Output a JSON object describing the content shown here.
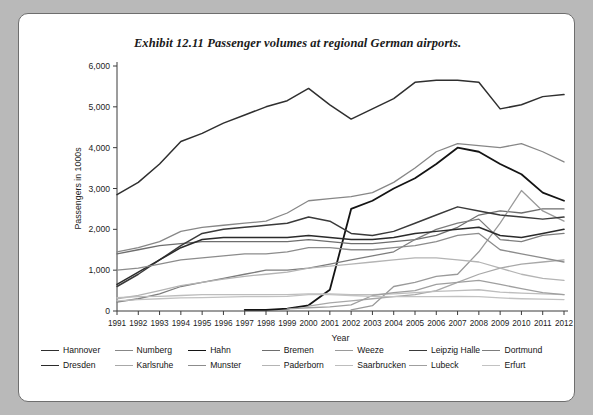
{
  "figure": {
    "title": "Exhibit 12.11   Passenger volumes at regional German airports.",
    "background_outer": "#b9b9b9",
    "background_panel": "#ffffff"
  },
  "chart_data": {
    "type": "line",
    "title": "Exhibit 12.11   Passenger volumes at regional German airports.",
    "xlabel": "Year",
    "ylabel": "Passengers in 1000s",
    "x": [
      1991,
      1992,
      1993,
      1994,
      1995,
      1996,
      1997,
      1998,
      1999,
      2000,
      2001,
      2002,
      2003,
      2004,
      2005,
      2006,
      2007,
      2008,
      2009,
      2010,
      2011,
      2012
    ],
    "xticklabels": [
      "1991",
      "1992",
      "1993",
      "1994",
      "1995",
      "1996",
      "1997",
      "1998",
      "1999",
      "2000",
      "2001",
      "2002",
      "2003",
      "2004",
      "2005",
      "2006",
      "2007",
      "2008",
      "2009",
      "2010",
      "2011",
      "2012"
    ],
    "yticklabels": [
      "0",
      "1,000",
      "2,000",
      "3,000",
      "4,000",
      "5,000",
      "6,000"
    ],
    "ylim": [
      0,
      6000
    ],
    "ytick_step": 1000,
    "xlim": [
      1991,
      2012
    ],
    "grid": false,
    "legend_position": "bottom",
    "series": [
      {
        "name": "Hannover",
        "color": "#2f2f2f",
        "width": 1.5,
        "values": [
          2850,
          3150,
          3600,
          4150,
          4350,
          4600,
          4800,
          5000,
          5150,
          5450,
          5050,
          4700,
          4950,
          5200,
          5600,
          5650,
          5650,
          5600,
          4950,
          5050,
          5250,
          5300
        ]
      },
      {
        "name": "Numberg",
        "color": "#878787",
        "width": 1.3,
        "values": [
          1450,
          1550,
          1700,
          1950,
          2050,
          2100,
          2150,
          2200,
          2400,
          2700,
          2750,
          2800,
          2900,
          3150,
          3500,
          3900,
          4100,
          4050,
          4000,
          4100,
          3900,
          3650
        ]
      },
      {
        "name": "Hahn",
        "color": "#141414",
        "width": 1.8,
        "values": [
          null,
          null,
          null,
          null,
          null,
          null,
          30,
          30,
          60,
          140,
          520,
          2500,
          2700,
          3000,
          3250,
          3600,
          4000,
          3900,
          3600,
          3350,
          2900,
          2700
        ]
      },
      {
        "name": "Bremen",
        "color": "#6e6e6e",
        "width": 1.3,
        "values": [
          1400,
          1500,
          1600,
          1650,
          1700,
          1700,
          1700,
          1700,
          1700,
          1750,
          1700,
          1650,
          1650,
          1700,
          1750,
          1850,
          2050,
          2350,
          2450,
          2400,
          2500,
          2500
        ]
      },
      {
        "name": "Weeze",
        "color": "#9a9a9a",
        "width": 1.3,
        "values": [
          null,
          null,
          null,
          null,
          null,
          null,
          null,
          null,
          null,
          null,
          null,
          30,
          130,
          600,
          700,
          850,
          900,
          1450,
          2150,
          2950,
          2450,
          2200
        ]
      },
      {
        "name": "Leipzig Halle",
        "color": "#3a3a3a",
        "width": 1.5,
        "values": [
          600,
          900,
          1250,
          1600,
          1900,
          2000,
          2050,
          2100,
          2150,
          2300,
          2200,
          1900,
          1850,
          1950,
          2150,
          2350,
          2550,
          2450,
          2350,
          2300,
          2250,
          2300
        ]
      },
      {
        "name": "Dortmund",
        "color": "#7d7d7d",
        "width": 1.3,
        "values": [
          220,
          300,
          420,
          600,
          700,
          800,
          900,
          1000,
          1000,
          1050,
          1150,
          1250,
          1350,
          1450,
          1750,
          2000,
          2150,
          2250,
          1750,
          1700,
          1850,
          1900
        ]
      },
      {
        "name": "Dresden",
        "color": "#2b2b2b",
        "width": 1.5,
        "values": [
          650,
          950,
          1250,
          1550,
          1750,
          1800,
          1800,
          1800,
          1800,
          1850,
          1800,
          1750,
          1750,
          1800,
          1900,
          1950,
          2000,
          2050,
          1850,
          1800,
          1900,
          2000
        ]
      },
      {
        "name": "Karlsruhe",
        "color": "#a8a8a8",
        "width": 1.3,
        "values": [
          null,
          null,
          null,
          null,
          null,
          null,
          null,
          null,
          null,
          120,
          200,
          250,
          300,
          350,
          400,
          500,
          700,
          900,
          1050,
          1150,
          1200,
          1250
        ]
      },
      {
        "name": "Munster",
        "color": "#8c8c8c",
        "width": 1.3,
        "values": [
          1000,
          1050,
          1150,
          1250,
          1300,
          1350,
          1400,
          1400,
          1450,
          1550,
          1550,
          1500,
          1500,
          1550,
          1600,
          1700,
          1850,
          1900,
          1500,
          1400,
          1300,
          1200
        ]
      },
      {
        "name": "Paderborn",
        "color": "#b4b4b4",
        "width": 1.3,
        "values": [
          300,
          380,
          500,
          620,
          700,
          780,
          850,
          900,
          950,
          1050,
          1100,
          1150,
          1200,
          1250,
          1300,
          1300,
          1250,
          1200,
          1050,
          900,
          800,
          750
        ]
      },
      {
        "name": "Saarbrucken",
        "color": "#bdbdbd",
        "width": 1.3,
        "values": [
          330,
          350,
          360,
          380,
          400,
          400,
          400,
          400,
          400,
          420,
          420,
          400,
          400,
          420,
          450,
          480,
          500,
          520,
          460,
          440,
          420,
          400
        ]
      },
      {
        "name": "Lubeck",
        "color": "#9f9f9f",
        "width": 1.3,
        "values": [
          null,
          null,
          null,
          null,
          null,
          null,
          null,
          null,
          50,
          80,
          100,
          150,
          380,
          450,
          500,
          650,
          700,
          750,
          650,
          550,
          450,
          400
        ]
      },
      {
        "name": "Erfurt",
        "color": "#c2c2c2",
        "width": 1.3,
        "values": [
          250,
          280,
          300,
          320,
          330,
          340,
          350,
          350,
          360,
          400,
          400,
          380,
          360,
          350,
          350,
          350,
          360,
          350,
          320,
          300,
          290,
          280
        ]
      }
    ]
  },
  "legend": {
    "row1": [
      {
        "label": "Hannover",
        "color": "#2f2f2f"
      },
      {
        "label": "Numberg",
        "color": "#878787"
      },
      {
        "label": "Hahn",
        "color": "#141414"
      },
      {
        "label": "Bremen",
        "color": "#6e6e6e"
      },
      {
        "label": "Weeze",
        "color": "#9a9a9a"
      },
      {
        "label": "Leipzig Halle",
        "color": "#3a3a3a"
      },
      {
        "label": "Dortmund",
        "color": "#7d7d7d"
      }
    ],
    "row2": [
      {
        "label": "Dresden",
        "color": "#2b2b2b"
      },
      {
        "label": "Karlsruhe",
        "color": "#a8a8a8"
      },
      {
        "label": "Munster",
        "color": "#8c8c8c"
      },
      {
        "label": "Paderborn",
        "color": "#b4b4b4"
      },
      {
        "label": "Saarbrucken",
        "color": "#bdbdbd"
      },
      {
        "label": "Lubeck",
        "color": "#9f9f9f"
      },
      {
        "label": "Erfurt",
        "color": "#c2c2c2"
      }
    ]
  }
}
